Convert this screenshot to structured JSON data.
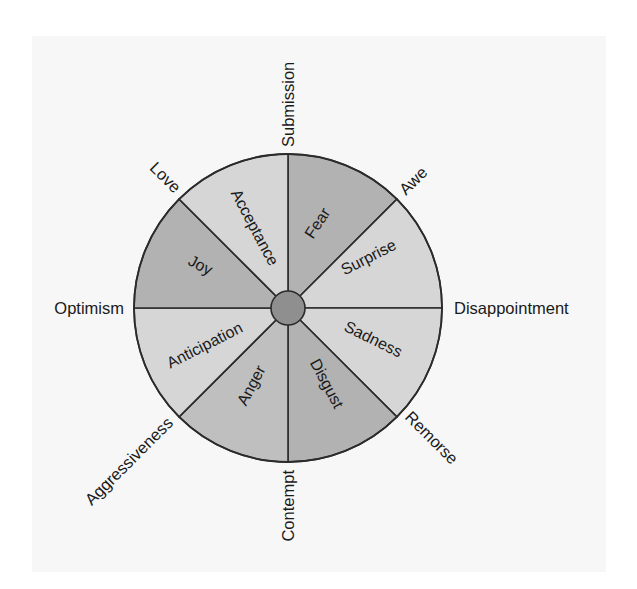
{
  "diagram": {
    "type": "emotion-wheel",
    "center": {
      "x": 288,
      "y": 308
    },
    "radius": 154,
    "hub_radius": 17,
    "colors": {
      "outline": "#2b2b2b",
      "hub": "#8f8f8f",
      "dark_segment": "#b2b2b2",
      "medium_segment": "#bfbfbf",
      "light_segment": "#d6d6d6",
      "panel_background": "#f7f7f7",
      "text": "#1a1a1a"
    },
    "segments": [
      {
        "label": "Fear",
        "shade": "dark"
      },
      {
        "label": "Surprise",
        "shade": "light"
      },
      {
        "label": "Sadness",
        "shade": "light"
      },
      {
        "label": "Disgust",
        "shade": "dark"
      },
      {
        "label": "Anger",
        "shade": "medium"
      },
      {
        "label": "Anticipation",
        "shade": "light"
      },
      {
        "label": "Joy",
        "shade": "dark"
      },
      {
        "label": "Acceptance",
        "shade": "light"
      }
    ],
    "dyads": [
      {
        "label": "Submission",
        "between": [
          "Acceptance",
          "Fear"
        ]
      },
      {
        "label": "Awe",
        "between": [
          "Fear",
          "Surprise"
        ]
      },
      {
        "label": "Disappointment",
        "between": [
          "Surprise",
          "Sadness"
        ]
      },
      {
        "label": "Remorse",
        "between": [
          "Sadness",
          "Disgust"
        ]
      },
      {
        "label": "Contempt",
        "between": [
          "Disgust",
          "Anger"
        ]
      },
      {
        "label": "Aggressiveness",
        "between": [
          "Anger",
          "Anticipation"
        ]
      },
      {
        "label": "Optimism",
        "between": [
          "Anticipation",
          "Joy"
        ]
      },
      {
        "label": "Love",
        "between": [
          "Joy",
          "Acceptance"
        ]
      }
    ]
  }
}
